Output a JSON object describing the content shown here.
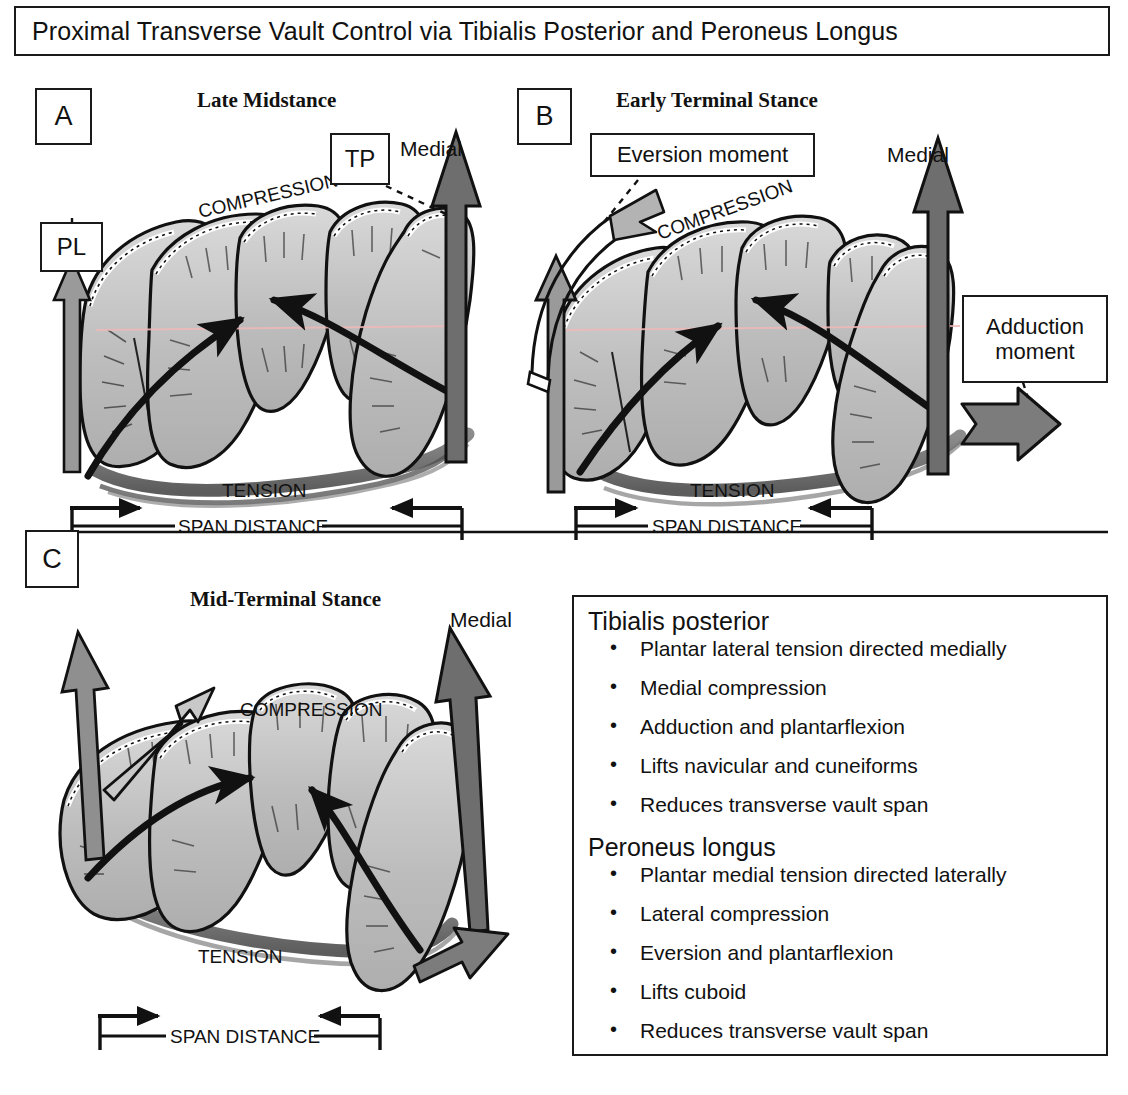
{
  "title": "Proximal Transverse Vault Control via Tibialis Posterior and Peroneus Longus",
  "panels": {
    "a": {
      "label": "A",
      "stance": "Late Midstance",
      "muscle_tp": "TP",
      "muscle_pl": "PL",
      "medial": "Medial",
      "compression": "COMPRESSION",
      "tension": "TENSION",
      "span": "SPAN DISTANCE"
    },
    "b": {
      "label": "B",
      "stance": "Early Terminal Stance",
      "eversion": "Eversion  moment",
      "adduction_line1": "Adduction",
      "adduction_line2": "moment",
      "medial": "Medial",
      "compression": "COMPRESSION",
      "tension": "TENSION",
      "span": "SPAN DISTANCE"
    },
    "c": {
      "label": "C",
      "stance": "Mid-Terminal Stance",
      "medial": "Medial",
      "compression": "COMPRESSION",
      "tension": "TENSION",
      "span": "SPAN DISTANCE"
    }
  },
  "legend": {
    "tp_heading": "Tibialis posterior",
    "tp_items": [
      "Plantar lateral tension directed medially",
      "Medial compression",
      "Adduction and plantarflexion",
      "Lifts navicular and cuneiforms",
      "Reduces transverse vault span"
    ],
    "pl_heading": "Peroneus longus",
    "pl_items": [
      "Plantar medial tension directed laterally",
      "Lateral compression",
      "Eversion and plantarflexion",
      "Lifts cuboid",
      "Reduces transverse vault span"
    ],
    "bullet": "•"
  },
  "colors": {
    "outline": "#1a1a1a",
    "bone_fill": "#b9b9b9",
    "bone_light": "#d6d6d6",
    "tendon": "#6e6e6e",
    "arrow_gray": "#8a8a8a",
    "background": "#ffffff"
  }
}
